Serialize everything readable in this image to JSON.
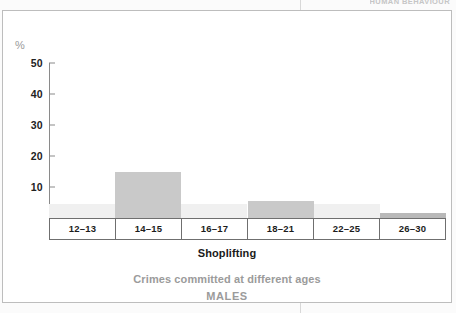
{
  "page": {
    "running_head": "HUMAN BEHAVIOUR"
  },
  "chart_data": {
    "type": "bar",
    "title": "Shoplifting",
    "subtitle": "Crimes committed at different ages",
    "group_label": "MALES",
    "xlabel": "Shoplifting",
    "ylabel": "%",
    "categories": [
      "12–13",
      "14–15",
      "16–17",
      "18–21",
      "22–25",
      "26–30"
    ],
    "values": [
      4.5,
      15,
      4.5,
      5.5,
      4.5,
      1.5
    ],
    "series": [
      {
        "name": "Shoplifting offenders (males)",
        "values": [
          4.5,
          15,
          4.5,
          5.5,
          4.5,
          1.5
        ]
      }
    ],
    "bar_colors": [
      "#f0f0f0",
      "#c9c9c9",
      "#f0f0f0",
      "#c9c9c9",
      "#f0f0f0",
      "#b9b9b9"
    ],
    "ylim": [
      0,
      50
    ],
    "yticks": [
      50,
      40,
      30,
      20,
      10
    ],
    "ytick_labels": [
      "50",
      "40",
      "30",
      "20",
      "10"
    ],
    "grid": false,
    "legend": "none",
    "axis_color": "#6f6f6f"
  }
}
